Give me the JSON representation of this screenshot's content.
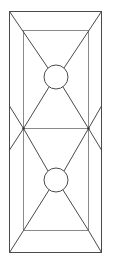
{
  "diagram": {
    "type": "geometric line drawing",
    "colors": {
      "line": "#4a4a4a",
      "inner_line": "#8a8a8a",
      "background": "#ffffff"
    },
    "outer_rect": {
      "x1": 9,
      "y1": 11,
      "x2": 102,
      "y2": 253
    },
    "inner_rect": {
      "x1": 23,
      "y1": 30,
      "x2": 88,
      "y2": 231
    },
    "midline_y": 128,
    "circles": [
      {
        "cx": 56,
        "cy": 77,
        "r": 12
      },
      {
        "cx": 56,
        "cy": 180,
        "r": 12
      }
    ]
  }
}
